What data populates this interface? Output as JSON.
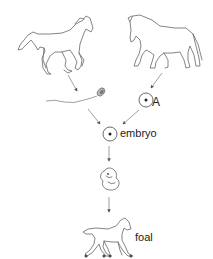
{
  "diagram": {
    "type": "flow",
    "nodes": [
      {
        "id": "stallion",
        "kind": "illustration",
        "icon": "horse-icon",
        "label": ""
      },
      {
        "id": "mare",
        "kind": "illustration",
        "icon": "horse-icon",
        "label": ""
      },
      {
        "id": "sperm",
        "kind": "illustration",
        "icon": "sperm-icon",
        "label": ""
      },
      {
        "id": "egg",
        "kind": "illustration",
        "icon": "egg-cell-icon",
        "label": "A"
      },
      {
        "id": "embryo",
        "kind": "illustration",
        "icon": "zygote-icon",
        "label": "embryo"
      },
      {
        "id": "fetus",
        "kind": "illustration",
        "icon": "fetus-icon",
        "label": ""
      },
      {
        "id": "foal",
        "kind": "illustration",
        "icon": "foal-icon",
        "label": "foal"
      }
    ],
    "edges": [
      {
        "from": "stallion",
        "to": "sperm"
      },
      {
        "from": "mare",
        "to": "egg"
      },
      {
        "from": "sperm",
        "to": "embryo"
      },
      {
        "from": "egg",
        "to": "embryo"
      },
      {
        "from": "embryo",
        "to": "fetus"
      },
      {
        "from": "fetus",
        "to": "foal"
      }
    ]
  },
  "labels": {
    "egg": "A",
    "embryo": "embryo",
    "foal": "foal"
  },
  "colors": {
    "line": "#666666",
    "arrow": "#777777",
    "text": "#222222",
    "background": "#ffffff"
  }
}
